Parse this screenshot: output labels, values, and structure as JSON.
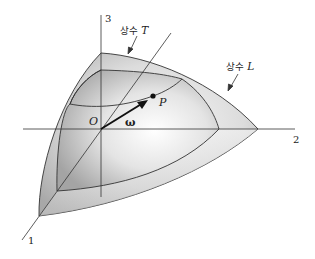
{
  "figure": {
    "axes": [
      {
        "id": "1",
        "label": "1"
      },
      {
        "id": "2",
        "label": "2"
      },
      {
        "id": "3",
        "label": "3"
      }
    ],
    "origin_label": "O",
    "point_label": "P",
    "vector_label": "ω",
    "surfaces": [
      {
        "id": "constant-T",
        "label_ko": "상수",
        "label_var": "T"
      },
      {
        "id": "constant-L",
        "label_ko": "상수",
        "label_var": "L"
      }
    ],
    "colors": {
      "line": "#333333",
      "surface_light": "#f4f4f4",
      "surface_dark": "#a9a9a9",
      "background": "#ffffff"
    }
  }
}
